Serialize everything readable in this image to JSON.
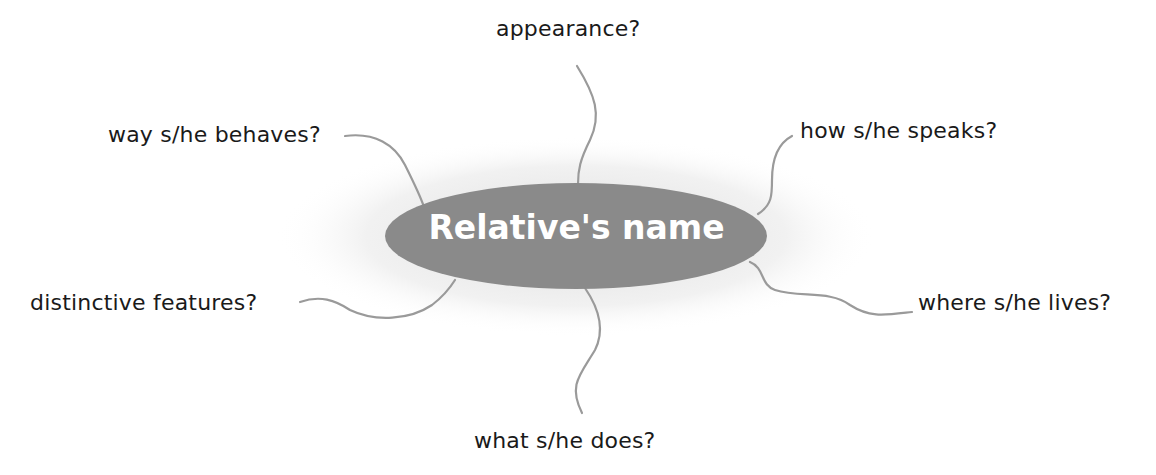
{
  "diagram": {
    "type": "mind-map",
    "center": {
      "label": "Relative's name",
      "fill": "#8a8a8a",
      "text_color": "#ffffff"
    },
    "branch_color": "#999999",
    "branches": [
      {
        "label": "appearance?"
      },
      {
        "label": "how s/he speaks?"
      },
      {
        "label": "where s/he lives?"
      },
      {
        "label": "what s/he does?"
      },
      {
        "label": "distinctive features?"
      },
      {
        "label": "way s/he behaves?"
      }
    ]
  }
}
